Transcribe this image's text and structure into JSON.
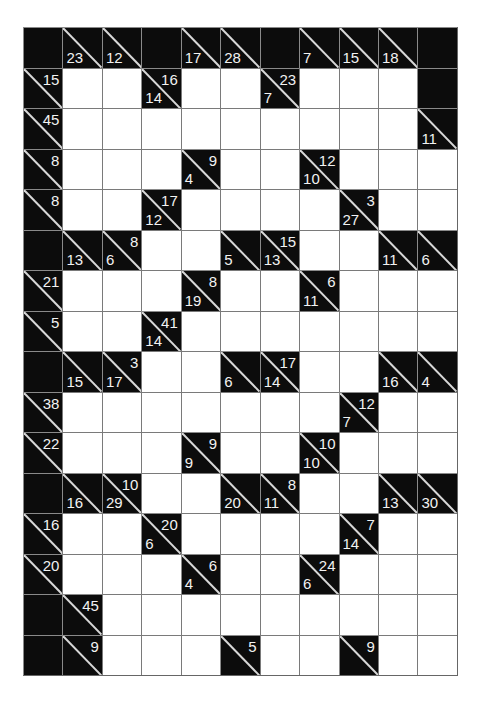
{
  "puzzle": {
    "type": "kakuro",
    "columns": 11,
    "rows": 16,
    "legend": {
      "B": "blank black cell",
      "W": "empty white cell",
      "clue": "black cell with diagonal; 'd' = down sum (bottom-left), 'r' = across sum (top-right)"
    },
    "colors": {
      "black": "#0c0c0c",
      "white": "#ffffff",
      "grid_line": "#7a7a7a",
      "clue_text": "#f2f2f2"
    },
    "grid": [
      [
        "B",
        {
          "d": 23
        },
        {
          "d": 12
        },
        "B",
        {
          "d": 17
        },
        {
          "d": 28
        },
        "B",
        {
          "d": 7
        },
        {
          "d": 15
        },
        {
          "d": 18
        },
        "B"
      ],
      [
        {
          "r": 15
        },
        "W",
        "W",
        {
          "d": 14,
          "r": 16
        },
        "W",
        "W",
        {
          "d": 7,
          "r": 23
        },
        "W",
        "W",
        "W",
        "B"
      ],
      [
        {
          "r": 45
        },
        "W",
        "W",
        "W",
        "W",
        "W",
        "W",
        "W",
        "W",
        "W",
        {
          "d": 11
        }
      ],
      [
        {
          "r": 8
        },
        "W",
        "W",
        "W",
        {
          "d": 4,
          "r": 9
        },
        "W",
        "W",
        {
          "d": 10,
          "r": 12
        },
        "W",
        "W",
        "W"
      ],
      [
        {
          "r": 8
        },
        "W",
        "W",
        {
          "d": 12,
          "r": 17
        },
        "W",
        "W",
        "W",
        "W",
        {
          "d": 27,
          "r": 3
        },
        "W",
        "W"
      ],
      [
        "B",
        {
          "d": 13
        },
        {
          "d": 6,
          "r": 8
        },
        "W",
        "W",
        {
          "d": 5
        },
        {
          "d": 13,
          "r": 15
        },
        "W",
        "W",
        {
          "d": 11
        },
        {
          "d": 6
        }
      ],
      [
        {
          "r": 21
        },
        "W",
        "W",
        "W",
        {
          "d": 19,
          "r": 8
        },
        "W",
        "W",
        {
          "d": 11,
          "r": 6
        },
        "W",
        "W",
        "W"
      ],
      [
        {
          "r": 5
        },
        "W",
        "W",
        {
          "d": 14,
          "r": 41
        },
        "W",
        "W",
        "W",
        "W",
        "W",
        "W",
        "W"
      ],
      [
        "B",
        {
          "d": 15
        },
        {
          "d": 17,
          "r": 3
        },
        "W",
        "W",
        {
          "d": 6
        },
        {
          "d": 14,
          "r": 17
        },
        "W",
        "W",
        {
          "d": 16
        },
        {
          "d": 4
        }
      ],
      [
        {
          "r": 38
        },
        "W",
        "W",
        "W",
        "W",
        "W",
        "W",
        "W",
        {
          "d": 7,
          "r": 12
        },
        "W",
        "W"
      ],
      [
        {
          "r": 22
        },
        "W",
        "W",
        "W",
        {
          "d": 9,
          "r": 9
        },
        "W",
        "W",
        {
          "d": 10,
          "r": 10
        },
        "W",
        "W",
        "W"
      ],
      [
        "B",
        {
          "d": 16
        },
        {
          "d": 29,
          "r": 10
        },
        "W",
        "W",
        {
          "d": 20
        },
        {
          "d": 11,
          "r": 8
        },
        "W",
        "W",
        {
          "d": 13
        },
        {
          "d": 30
        }
      ],
      [
        {
          "r": 16
        },
        "W",
        "W",
        {
          "d": 6,
          "r": 20
        },
        "W",
        "W",
        "W",
        "W",
        {
          "d": 14,
          "r": 7
        },
        "W",
        "W"
      ],
      [
        {
          "r": 20
        },
        "W",
        "W",
        "W",
        {
          "d": 4,
          "r": 6
        },
        "W",
        "W",
        {
          "d": 6,
          "r": 24
        },
        "W",
        "W",
        "W"
      ],
      [
        "B",
        {
          "r": 45
        },
        "W",
        "W",
        "W",
        "W",
        "W",
        "W",
        "W",
        "W",
        "W"
      ],
      [
        "B",
        {
          "r": 9
        },
        "W",
        "W",
        "W",
        {
          "r": 5
        },
        "W",
        "W",
        {
          "r": 9
        },
        "W",
        "W"
      ]
    ]
  }
}
